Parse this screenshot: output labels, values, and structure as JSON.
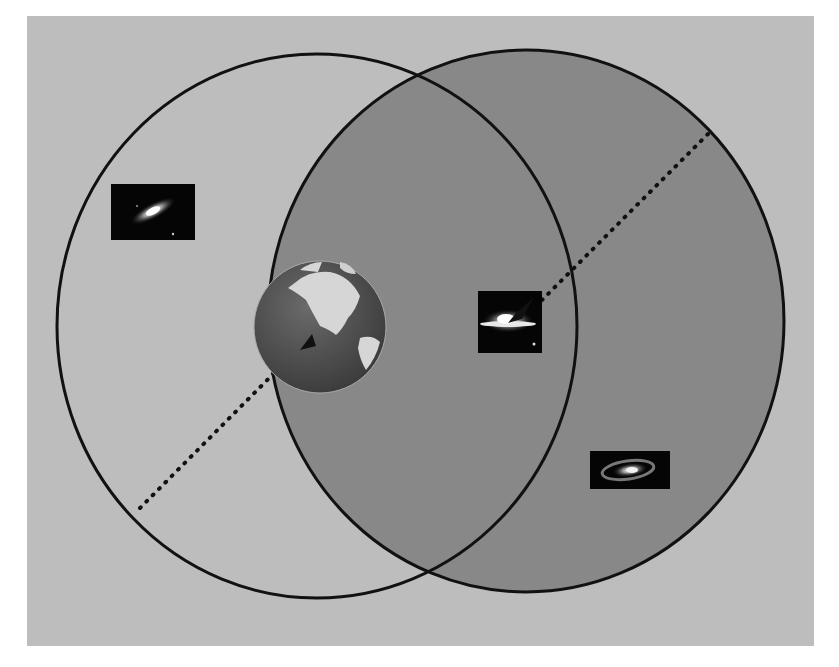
{
  "figure": {
    "type": "venn-cosmology-diagram",
    "colors": {
      "background": "#ffffff",
      "panel": "#bdbdbd",
      "right_circle_fill": "#888888",
      "circle_stroke": "#111111",
      "dotted_line": "#111111"
    },
    "circles": [
      {
        "name": "observer-horizon-earth",
        "cx": 317,
        "cy": 326,
        "rx": 260,
        "ry": 272,
        "filled": false
      },
      {
        "name": "observer-horizon-galaxy",
        "cx": 526,
        "cy": 321,
        "rx": 258,
        "ry": 271,
        "filled": true
      }
    ],
    "objects": [
      {
        "name": "galaxy-top-left",
        "icon": "spiral-galaxy-icon",
        "x": 111,
        "y": 184,
        "w": 84,
        "h": 56
      },
      {
        "name": "earth-globe",
        "icon": "earth-globe-icon",
        "cx": 320,
        "cy": 327,
        "r": 66
      },
      {
        "name": "galaxy-center-right",
        "icon": "edge-on-galaxy-icon",
        "x": 478,
        "y": 291,
        "w": 64,
        "h": 62
      },
      {
        "name": "galaxy-bottom-right",
        "icon": "spiral-galaxy-icon",
        "x": 590,
        "y": 451,
        "w": 80,
        "h": 38
      }
    ],
    "radius_lines": [
      {
        "name": "earth-radius-line",
        "x1": 140,
        "y1": 508,
        "x2": 312,
        "y2": 334
      },
      {
        "name": "galaxy-radius-line",
        "x1": 708,
        "y1": 134,
        "x2": 528,
        "y2": 314
      }
    ],
    "caption": "Figure ... (caption text cut off at bottom of image)"
  }
}
